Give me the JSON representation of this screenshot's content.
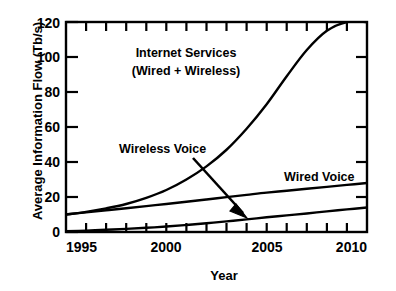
{
  "chart_data": {
    "type": "line",
    "title": "",
    "xlabel": "Year",
    "ylabel": "Average Information Flow (Tb/s)",
    "xlim": [
      1995,
      2010
    ],
    "ylim": [
      0,
      120
    ],
    "xticks": [
      1995,
      2000,
      2005,
      2010
    ],
    "xtick_labels": [
      "1995",
      "2000",
      "2005",
      "2010"
    ],
    "x_minor_tick_step": 1,
    "yticks": [
      0,
      20,
      40,
      60,
      80,
      100,
      120
    ],
    "ytick_labels": [
      "0",
      "20",
      "40",
      "60",
      "80",
      "100",
      "120"
    ],
    "grid": false,
    "legend_position": "inline-annotations",
    "line_color": "#000000",
    "background_color": "#ffffff",
    "x": [
      1995,
      1996,
      1997,
      1998,
      1999,
      2000,
      2001,
      2002,
      2003,
      2004,
      2005,
      2006,
      2007,
      2008,
      2009,
      2010
    ],
    "series": [
      {
        "name": "Internet Services (Wired + Wireless)",
        "values": [
          10,
          11.5,
          13.5,
          16,
          19.5,
          24,
          30,
          37.5,
          47,
          59,
          73,
          89,
          104,
          115,
          120,
          120
        ]
      },
      {
        "name": "Wired Voice",
        "values": [
          10,
          11.2,
          12.4,
          13.6,
          14.8,
          16,
          17.3,
          18.6,
          19.9,
          21.2,
          22.5,
          23.6,
          24.7,
          25.8,
          26.9,
          28
        ]
      },
      {
        "name": "Wireless Voice",
        "values": [
          0.4,
          0.8,
          1.3,
          1.8,
          2.4,
          3.1,
          4,
          5,
          6.1,
          7.2,
          8.4,
          9.5,
          10.6,
          11.8,
          12.9,
          14
        ]
      }
    ],
    "annotations": [
      {
        "name": "internet-services-label",
        "text_lines": [
          "Internet Services",
          "(Wired + Wireless)"
        ],
        "x": 2002.5,
        "y": 105
      },
      {
        "name": "wireless-voice-label",
        "text_lines": [
          "Wireless Voice"
        ],
        "x": 1999.2,
        "y": 50,
        "arrow_to_x": 2004.0,
        "arrow_to_y": 8.0
      },
      {
        "name": "wired-voice-label",
        "text_lines": [
          "Wired Voice"
        ],
        "x": 2007.2,
        "y": 33
      }
    ]
  }
}
